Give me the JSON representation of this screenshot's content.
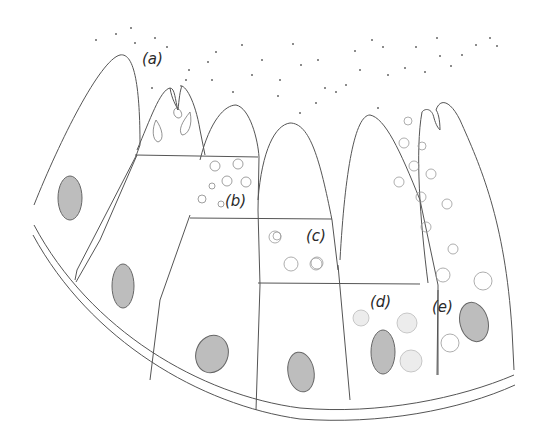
{
  "figure": {
    "type": "secretory cell cycle diagram",
    "labels": [
      {
        "id": "a",
        "text": "(a)",
        "x": 142,
        "y": 58
      },
      {
        "id": "b",
        "text": "(b)",
        "x": 225,
        "y": 192
      },
      {
        "id": "c",
        "text": "(c)",
        "x": 306,
        "y": 227
      },
      {
        "id": "d",
        "text": "(d)",
        "x": 370,
        "y": 293
      },
      {
        "id": "e",
        "text": "(e)",
        "x": 432,
        "y": 298
      }
    ],
    "colors": {
      "line": "#555555",
      "nucleus_fill": "#bdbdbd",
      "granule_stroke": "#888888",
      "dot": "#666666"
    }
  }
}
